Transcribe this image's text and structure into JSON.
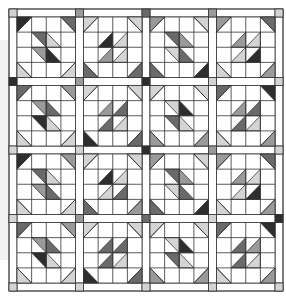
{
  "layout": {
    "rows": 4,
    "cols": 4,
    "cells_per_block": 4,
    "quilt_left": 9,
    "quilt_top": 9,
    "sash": 8,
    "block_w": 58.5,
    "block_h": 60.5
  },
  "colors": {
    "white": "#ffffff",
    "line": "#333333",
    "sash_fill": "#ffffff",
    "shades": {
      "L": "#d4d4d4",
      "M": "#9a9a9a",
      "D": "#6a6a6a",
      "K": "#2e2e2e"
    }
  },
  "cornerstones": [
    [
      "L",
      "M",
      "D",
      "M",
      "L"
    ],
    [
      "K",
      "M",
      "K",
      "L",
      "L"
    ],
    [
      "L",
      "L",
      "K",
      "M",
      "L"
    ],
    [
      "L",
      "M",
      "D",
      "L",
      "K"
    ],
    [
      "L",
      "L",
      "L",
      "L",
      "L"
    ]
  ],
  "blocks": [
    [
      {
        "dir": "bs",
        "corners": [
          "K",
          "D",
          "L",
          "L"
        ],
        "center": [
          "D",
          "L",
          "M",
          "K"
        ]
      },
      {
        "dir": "fs",
        "corners": [
          "L",
          "L",
          "D",
          "D"
        ],
        "center": [
          "K",
          "L",
          "M",
          "L"
        ]
      },
      {
        "dir": "bs",
        "corners": [
          "M",
          "L",
          "D",
          "K"
        ],
        "center": [
          "D",
          "M",
          "L",
          "D"
        ]
      },
      {
        "dir": "fs",
        "corners": [
          "M",
          "D",
          "L",
          "M"
        ],
        "center": [
          "M",
          "L",
          "L",
          "K"
        ]
      }
    ],
    [
      {
        "dir": "bs",
        "corners": [
          "D",
          "M",
          "L",
          "L"
        ],
        "center": [
          "M",
          "D",
          "K",
          "L"
        ]
      },
      {
        "dir": "fs",
        "corners": [
          "L",
          "L",
          "K",
          "D"
        ],
        "center": [
          "M",
          "D",
          "D",
          "L"
        ]
      },
      {
        "dir": "bs",
        "corners": [
          "L",
          "L",
          "M",
          "M"
        ],
        "center": [
          "L",
          "K",
          "D",
          "L"
        ]
      },
      {
        "dir": "fs",
        "corners": [
          "D",
          "K",
          "L",
          "M"
        ],
        "center": [
          "M",
          "D",
          "D",
          "L"
        ]
      }
    ],
    [
      {
        "dir": "bs",
        "corners": [
          "K",
          "M",
          "L",
          "L"
        ],
        "center": [
          "D",
          "L",
          "M",
          "D"
        ]
      },
      {
        "dir": "fs",
        "corners": [
          "L",
          "L",
          "D",
          "M"
        ],
        "center": [
          "K",
          "L",
          "L",
          "D"
        ]
      },
      {
        "dir": "bs",
        "corners": [
          "M",
          "L",
          "D",
          "K"
        ],
        "center": [
          "D",
          "M",
          "L",
          "D"
        ]
      },
      {
        "dir": "fs",
        "corners": [
          "M",
          "D",
          "L",
          "M"
        ],
        "center": [
          "M",
          "L",
          "L",
          "K"
        ]
      }
    ],
    [
      {
        "dir": "bs",
        "corners": [
          "D",
          "M",
          "L",
          "L"
        ],
        "center": [
          "M",
          "D",
          "K",
          "L"
        ]
      },
      {
        "dir": "fs",
        "corners": [
          "L",
          "L",
          "K",
          "D"
        ],
        "center": [
          "D",
          "D",
          "D",
          "L"
        ]
      },
      {
        "dir": "bs",
        "corners": [
          "L",
          "L",
          "M",
          "M"
        ],
        "center": [
          "L",
          "K",
          "D",
          "L"
        ]
      },
      {
        "dir": "fs",
        "corners": [
          "D",
          "K",
          "L",
          "M"
        ],
        "center": [
          "D",
          "M",
          "D",
          "L"
        ]
      }
    ]
  ]
}
